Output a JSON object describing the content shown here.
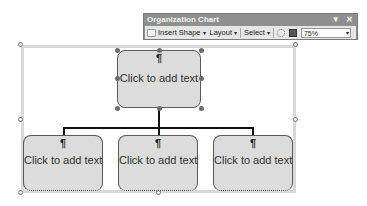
{
  "toolbar": {
    "title": "Organization Chart",
    "menu_glyph": "▼",
    "close_glyph": "✕",
    "insert_shape": "Insert Shape",
    "layout": "Layout",
    "select": "Select",
    "zoom_value": "75%",
    "caret": "▾",
    "icons": [
      "insert-shape-icon",
      "autoformat-icon",
      "fit-text-icon",
      "dropdown-icon"
    ]
  },
  "chart": {
    "paragraph_mark": "¶",
    "top_box": {
      "text": "Click to add text"
    },
    "subordinates": [
      {
        "text": "Click to add text"
      },
      {
        "text": "Click to add text"
      },
      {
        "text": "Click to add text"
      }
    ]
  },
  "colors": {
    "box_fill": "#dcdcdc",
    "box_border": "#5a5a5a",
    "connector": "#111111",
    "toolbar_title_bg": "#8f8f8f",
    "toolbar_row_bg": "#e6e6e6"
  }
}
